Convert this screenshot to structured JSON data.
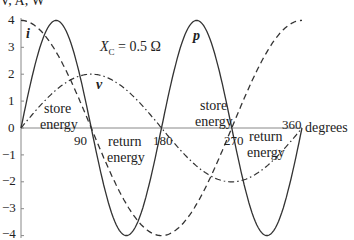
{
  "chart_data": {
    "type": "line",
    "title": "",
    "ylabel": "V, A, W",
    "xlabel": "degrees",
    "annotation": "X_C = 0.5 Ω",
    "xlim": [
      0,
      360
    ],
    "ylim": [
      -4,
      4
    ],
    "x_ticks": [
      90,
      180,
      270,
      360
    ],
    "y_ticks": [
      4,
      3,
      2,
      1,
      0,
      -1,
      -2,
      -3,
      -4
    ],
    "grid": false,
    "legend": "inline labels",
    "x": [
      0,
      45,
      90,
      135,
      180,
      225,
      270,
      315,
      360
    ],
    "series": [
      {
        "name": "i",
        "style": "dashed",
        "formula": "4cos(θ)",
        "values": [
          4,
          2.83,
          0,
          -2.83,
          -4,
          -2.83,
          0,
          2.83,
          4
        ]
      },
      {
        "name": "v",
        "style": "dash-dot",
        "formula": "2sin(θ)",
        "values": [
          0,
          1.41,
          2,
          1.41,
          0,
          -1.41,
          -2,
          -1.41,
          0
        ]
      },
      {
        "name": "p",
        "style": "solid",
        "formula": "4sin(2θ)",
        "values": [
          0,
          4,
          0,
          -4,
          0,
          4,
          0,
          -4,
          0
        ]
      }
    ],
    "region_labels": [
      {
        "text": "store energy",
        "range": [
          0,
          90
        ]
      },
      {
        "text": "return energy",
        "range": [
          90,
          180
        ]
      },
      {
        "text": "store energy",
        "range": [
          180,
          270
        ]
      },
      {
        "text": "return energy",
        "range": [
          270,
          360
        ]
      }
    ]
  },
  "labels": {
    "ylabel": "V, A, W",
    "xlabel": "degrees",
    "xc_main": "X",
    "xc_sub": "C",
    "xc_rest": " = 0.5 Ω",
    "series_i": "i",
    "series_v": "v",
    "series_p": "p",
    "store": "store",
    "return": "return",
    "energy": "energy",
    "x90": "90",
    "x180": "180",
    "x270": "270",
    "x360": "360",
    "y4": "4",
    "y3": "3",
    "y2": "2",
    "y1": "1",
    "y0": "0",
    "ym1": "−1",
    "ym2": "−2",
    "ym3": "−3",
    "ym4": "−4"
  }
}
